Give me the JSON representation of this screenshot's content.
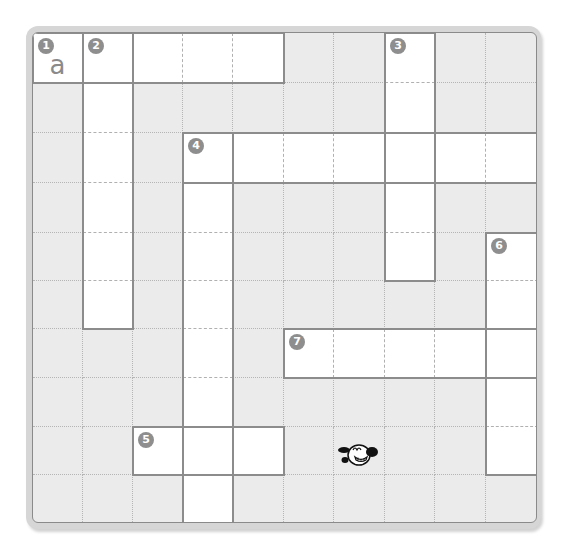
{
  "puzzle": {
    "type": "crossword",
    "rows": 10,
    "cols": 10,
    "white_cells": [
      [
        0,
        0
      ],
      [
        0,
        1
      ],
      [
        0,
        2
      ],
      [
        0,
        3
      ],
      [
        0,
        4
      ],
      [
        0,
        7
      ],
      [
        1,
        1
      ],
      [
        1,
        7
      ],
      [
        2,
        1
      ],
      [
        2,
        3
      ],
      [
        2,
        4
      ],
      [
        2,
        5
      ],
      [
        2,
        6
      ],
      [
        2,
        7
      ],
      [
        2,
        8
      ],
      [
        2,
        9
      ],
      [
        3,
        1
      ],
      [
        3,
        3
      ],
      [
        3,
        7
      ],
      [
        4,
        1
      ],
      [
        4,
        3
      ],
      [
        4,
        7
      ],
      [
        4,
        9
      ],
      [
        5,
        1
      ],
      [
        5,
        3
      ],
      [
        5,
        9
      ],
      [
        6,
        3
      ],
      [
        6,
        5
      ],
      [
        6,
        6
      ],
      [
        6,
        7
      ],
      [
        6,
        8
      ],
      [
        6,
        9
      ],
      [
        7,
        3
      ],
      [
        7,
        9
      ],
      [
        8,
        2
      ],
      [
        8,
        3
      ],
      [
        8,
        4
      ],
      [
        8,
        9
      ],
      [
        9,
        3
      ]
    ],
    "clues": [
      {
        "number": "1",
        "row": 0,
        "col": 0
      },
      {
        "number": "2",
        "row": 0,
        "col": 1
      },
      {
        "number": "3",
        "row": 0,
        "col": 7
      },
      {
        "number": "4",
        "row": 2,
        "col": 3
      },
      {
        "number": "5",
        "row": 8,
        "col": 2
      },
      {
        "number": "6",
        "row": 4,
        "col": 9
      },
      {
        "number": "7",
        "row": 6,
        "col": 5
      }
    ],
    "entries": [
      {
        "row": 0,
        "col": 0,
        "letter": "a"
      }
    ],
    "words": [
      {
        "number": "1",
        "direction": "across",
        "row": 0,
        "col": 0,
        "length": 5
      },
      {
        "number": "2",
        "direction": "down",
        "row": 0,
        "col": 1,
        "length": 6
      },
      {
        "number": "3",
        "direction": "down",
        "row": 0,
        "col": 7,
        "length": 5
      },
      {
        "number": "4",
        "direction": "across",
        "row": 2,
        "col": 3,
        "length": 7
      },
      {
        "number": "4",
        "direction": "down",
        "row": 2,
        "col": 3,
        "length": 8
      },
      {
        "number": "5",
        "direction": "across",
        "row": 8,
        "col": 2,
        "length": 3
      },
      {
        "number": "6",
        "direction": "down",
        "row": 4,
        "col": 9,
        "length": 5
      },
      {
        "number": "7",
        "direction": "across",
        "row": 6,
        "col": 5,
        "length": 5
      }
    ]
  },
  "mascot": {
    "icon": "cartoon-dog-icon",
    "row": 8,
    "col": 6
  },
  "colors": {
    "block": "#ebebeb",
    "white": "#ffffff",
    "badge": "#8e8e8e",
    "border": "#8c8c8c",
    "frame": "#d6d6d6"
  }
}
